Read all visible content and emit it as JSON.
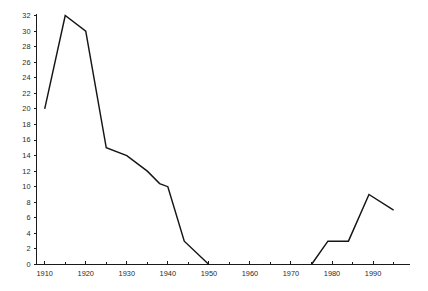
{
  "chart_data": {
    "type": "line",
    "title": "",
    "subtitle": "",
    "xlabel": "",
    "ylabel": "",
    "xlim": [
      1908,
      1999
    ],
    "ylim": [
      0,
      32
    ],
    "grid": false,
    "legend": null,
    "y_ticks": [
      0,
      2,
      4,
      6,
      8,
      10,
      12,
      14,
      16,
      18,
      20,
      22,
      24,
      26,
      28,
      30,
      32
    ],
    "y_tick_labels": [
      "0",
      "2",
      "4",
      "6",
      "8",
      "10",
      "12",
      "14",
      "16",
      "18",
      "20",
      "22",
      "24",
      "26",
      "28",
      "30",
      "32"
    ],
    "x_ticks_major": [
      1910,
      1920,
      1930,
      1940,
      1950,
      1960,
      1970,
      1980,
      1990
    ],
    "x_tick_labels": [
      "1910",
      "1920",
      "1930",
      "1940",
      "1950",
      "1960",
      "1970",
      "1980",
      "1990"
    ],
    "x_ticks_minor": [
      1915,
      1925,
      1935,
      1945,
      1955,
      1965,
      1975,
      1985,
      1995
    ],
    "series": [
      {
        "name": "series-1",
        "color": "#151515",
        "segments": [
          {
            "name": "early-period",
            "x": [
              1910,
              1915,
              1920,
              1925,
              1930,
              1935,
              1938,
              1940,
              1944,
              1950
            ],
            "y": [
              20,
              32,
              30,
              15,
              14,
              12,
              10.4,
              10,
              3,
              0
            ]
          },
          {
            "name": "late-period",
            "x": [
              1975,
              1979,
              1984,
              1989,
              1995
            ],
            "y": [
              0,
              3,
              3,
              9,
              7
            ]
          }
        ]
      }
    ]
  }
}
